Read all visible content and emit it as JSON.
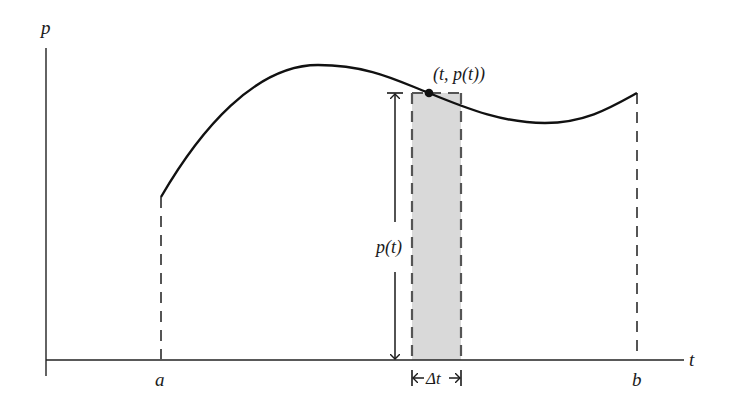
{
  "diagram": {
    "axes": {
      "y_label": "p",
      "x_label": "t"
    },
    "x_ticks": {
      "a": "a",
      "b": "b"
    },
    "point_label": "(t, p(t))",
    "height_label": "p(t)",
    "width_label": "Δt",
    "colors": {
      "curve": "#111111",
      "axis": "#222222",
      "dashed": "#555555",
      "shaded_rect": "#d9d9d9"
    }
  }
}
